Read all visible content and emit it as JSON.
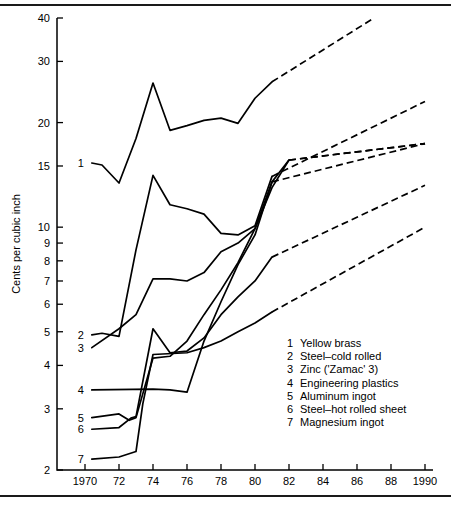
{
  "chart_data": {
    "type": "line",
    "title": "",
    "xlabel": "",
    "ylabel": "Cents per cubic inch",
    "yscale": "log",
    "ylim": [
      2,
      40
    ],
    "xlim": [
      1969,
      1990
    ],
    "grid": false,
    "legend_position": "inside-lower-right",
    "ytick_labels": [
      "40",
      "30",
      "20",
      "15",
      "10",
      "9",
      "8",
      "7",
      "6",
      "5",
      "4",
      "3",
      "2"
    ],
    "ytick_values": [
      40,
      30,
      20,
      15,
      10,
      9,
      8,
      7,
      6,
      5,
      4,
      3,
      2
    ],
    "xtick_labels": [
      "1970",
      "72",
      "74",
      "76",
      "78",
      "80",
      "82",
      "84",
      "86",
      "88",
      "1990"
    ],
    "xtick_values": [
      1970,
      1972,
      1974,
      1976,
      1978,
      1980,
      1982,
      1984,
      1986,
      1988,
      1990
    ],
    "series": [
      {
        "key": "1",
        "name": "Yellow brass",
        "label": "1",
        "solid_x": [
          1970.4,
          1971,
          1972,
          1973,
          1974,
          1975,
          1976,
          1977,
          1978,
          1979,
          1980,
          1981
        ],
        "solid_y": [
          15.3,
          15.1,
          13.4,
          18.0,
          26.0,
          19.0,
          19.6,
          20.3,
          20.6,
          19.9,
          23.5,
          26.2
        ],
        "dashed_x": [
          1981,
          1987
        ],
        "dashed_y": [
          26.2,
          40.0
        ]
      },
      {
        "key": "2",
        "name": "Steel–cold rolled",
        "label": "2",
        "solid_x": [
          1970.4,
          1971,
          1972,
          1973,
          1974,
          1975,
          1976,
          1977,
          1978,
          1979,
          1980,
          1981
        ],
        "solid_y": [
          4.9,
          4.95,
          4.85,
          8.6,
          14.1,
          11.6,
          11.3,
          10.9,
          9.6,
          9.5,
          10.1,
          14.0
        ],
        "dashed_x": [
          1981,
          1990
        ],
        "dashed_y": [
          14.0,
          23.0
        ]
      },
      {
        "key": "3",
        "name": "Zinc ('Zamac' 3)",
        "label": "3",
        "solid_x": [
          1970.4,
          1972,
          1973,
          1974,
          1975,
          1976,
          1977,
          1978,
          1979,
          1980,
          1981,
          1982
        ],
        "solid_y": [
          4.5,
          5.1,
          5.6,
          7.1,
          7.1,
          7.0,
          7.4,
          8.5,
          9.0,
          9.9,
          13.0,
          15.6
        ],
        "dashed_x": [
          1982,
          1990
        ],
        "dashed_y": [
          15.6,
          17.4
        ]
      },
      {
        "key": "4",
        "name": "Engineering plastics",
        "label": "4",
        "solid_x": [
          1970.4,
          1974,
          1975,
          1976,
          1977,
          1978,
          1979,
          1980,
          1981,
          1982
        ],
        "solid_y": [
          3.4,
          3.42,
          3.4,
          3.35,
          4.7,
          6.1,
          7.8,
          9.5,
          13.5,
          15.6
        ],
        "dashed_x": [
          1982,
          1990
        ],
        "dashed_y": [
          15.6,
          17.4
        ]
      },
      {
        "key": "5",
        "name": "Aluminum ingot",
        "label": "5",
        "solid_x": [
          1970.4,
          1972,
          1972.6,
          1973,
          1974,
          1975,
          1976,
          1977,
          1978,
          1979,
          1980,
          1981
        ],
        "solid_y": [
          2.83,
          2.9,
          2.78,
          2.83,
          4.2,
          4.25,
          4.7,
          5.6,
          6.6,
          7.9,
          9.9,
          13.5
        ],
        "dashed_x": [
          1981,
          1990
        ],
        "dashed_y": [
          13.5,
          17.4
        ]
      },
      {
        "key": "6",
        "name": "Steel–hot rolled sheet",
        "label": "6",
        "solid_x": [
          1970.4,
          1972,
          1972.7,
          1973,
          1974,
          1975,
          1976,
          1977,
          1978,
          1979,
          1980,
          1981
        ],
        "solid_y": [
          2.62,
          2.65,
          2.82,
          2.85,
          5.1,
          4.35,
          4.4,
          4.8,
          5.6,
          6.3,
          7.0,
          8.2
        ],
        "dashed_x": [
          1981,
          1990
        ],
        "dashed_y": [
          8.2,
          13.2
        ]
      },
      {
        "key": "7",
        "name": "Magnesium ingot",
        "label": "7",
        "solid_x": [
          1970.4,
          1972,
          1973,
          1973.4,
          1974,
          1976,
          1977,
          1978,
          1979,
          1980,
          1981
        ],
        "solid_y": [
          2.15,
          2.18,
          2.26,
          3.1,
          4.3,
          4.35,
          4.5,
          4.7,
          5.0,
          5.3,
          5.7
        ],
        "dashed_x": [
          1981,
          1990
        ],
        "dashed_y": [
          5.7,
          10.0
        ]
      }
    ]
  },
  "legend": {
    "items": [
      {
        "num": "1",
        "label": "Yellow brass"
      },
      {
        "num": "2",
        "label": "Steel–cold rolled"
      },
      {
        "num": "3",
        "label": "Zinc ('Zamac' 3)"
      },
      {
        "num": "4",
        "label": "Engineering plastics"
      },
      {
        "num": "5",
        "label": "Aluminum ingot"
      },
      {
        "num": "6",
        "label": "Steel–hot rolled sheet"
      },
      {
        "num": "7",
        "label": "Magnesium ingot"
      }
    ]
  },
  "axes": {
    "y_title": "Cents per cubic inch"
  },
  "colors": {
    "ink": "#000000",
    "rule": "#1a1a1a",
    "background": "#ffffff"
  }
}
